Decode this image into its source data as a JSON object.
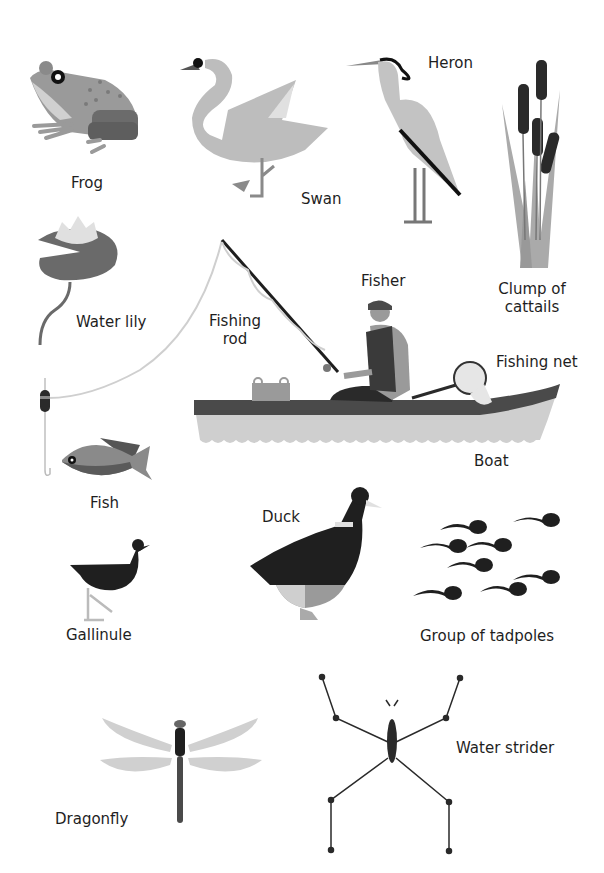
{
  "labels": {
    "frog": "Frog",
    "swan": "Swan",
    "heron": "Heron",
    "cattails_line1": "Clump of",
    "cattails_line2": "cattails",
    "water_lily": "Water lily",
    "fishing_rod_line1": "Fishing",
    "fishing_rod_line2": "rod",
    "fisher": "Fisher",
    "fishing_net": "Fishing net",
    "boat": "Boat",
    "fish": "Fish",
    "duck": "Duck",
    "gallinule": "Gallinule",
    "tadpoles": "Group of tadpoles",
    "dragonfly": "Dragonfly",
    "water_strider": "Water strider"
  },
  "colors": {
    "light": "#c9c9c9",
    "mid": "#9a9a9a",
    "dark": "#5a5a5a",
    "black": "#1f1f1f",
    "text": "#1e1e1e"
  }
}
